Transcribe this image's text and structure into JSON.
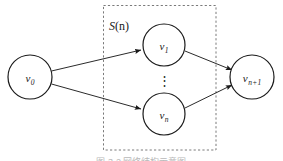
{
  "figure": {
    "type": "directed-graph-diagram",
    "group_label": {
      "symbol": "S",
      "arg": "(n)",
      "full": "S (n)"
    },
    "ellipsis": "⋮",
    "caption_partial": "图 3-2  网络结构示意图",
    "colors": {
      "stroke": "#1a1a1a",
      "dashed_box": "#7a7a7a",
      "background": "#ffffff",
      "caption": "#b9b9b9"
    },
    "nodes": [
      {
        "id": "v0",
        "base": "v",
        "sub": "0",
        "cx": 30,
        "cy": 77,
        "r": 22
      },
      {
        "id": "v1",
        "base": "v",
        "sub": "1",
        "cx": 164,
        "cy": 45,
        "r": 21
      },
      {
        "id": "vn",
        "base": "v",
        "sub": "n",
        "cx": 164,
        "cy": 114,
        "r": 21
      },
      {
        "id": "vn1",
        "base": "v",
        "sub": "n+1",
        "cx": 252,
        "cy": 77,
        "r": 22
      }
    ],
    "edges": [
      {
        "from": "v0",
        "to": "v1"
      },
      {
        "from": "v0",
        "to": "vn"
      },
      {
        "from": "v1",
        "to": "vn1"
      },
      {
        "from": "vn",
        "to": "vn1"
      }
    ],
    "dashed_box": {
      "x": 103,
      "y": 5,
      "width": 113,
      "height": 145
    }
  }
}
